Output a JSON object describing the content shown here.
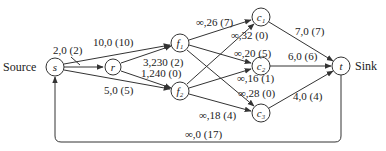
{
  "diagram": {
    "type": "network-flow",
    "source_label": "Source",
    "sink_label": "Sink",
    "nodes": [
      {
        "id": "s",
        "label": "s",
        "x": 55,
        "y": 67
      },
      {
        "id": "r",
        "label": "r",
        "x": 113,
        "y": 67
      },
      {
        "id": "f1",
        "label": "f₁",
        "x": 180,
        "y": 43
      },
      {
        "id": "f2",
        "label": "f₂",
        "x": 180,
        "y": 91
      },
      {
        "id": "c1",
        "label": "c₁",
        "x": 261,
        "y": 17
      },
      {
        "id": "c2",
        "label": "c₂",
        "x": 261,
        "y": 66
      },
      {
        "id": "c3",
        "label": "c₃",
        "x": 261,
        "y": 113
      },
      {
        "id": "t",
        "label": "t",
        "x": 341,
        "y": 66
      }
    ],
    "edges": [
      {
        "from": "s",
        "to": "r",
        "label": "2,0 (2)"
      },
      {
        "from": "s",
        "to": "f1",
        "label": "10,0 (10)"
      },
      {
        "from": "s",
        "to": "f2",
        "label": "5,0 (5)"
      },
      {
        "from": "r",
        "to": "f1",
        "label": "3,230 (2)"
      },
      {
        "from": "r",
        "to": "f2",
        "label": "1,240 (0)"
      },
      {
        "from": "f1",
        "to": "c1",
        "label": "∞,26 (7)"
      },
      {
        "from": "f2",
        "to": "c1",
        "label": "∞,32 (0)"
      },
      {
        "from": "f1",
        "to": "c2",
        "label": "∞,20 (5)"
      },
      {
        "from": "f2",
        "to": "c2",
        "label": "∞,16 (1)"
      },
      {
        "from": "f1",
        "to": "c3",
        "label": "∞,28 (0)"
      },
      {
        "from": "f2",
        "to": "c3",
        "label": "∞,18 (4)"
      },
      {
        "from": "c1",
        "to": "t",
        "label": "7,0 (7)"
      },
      {
        "from": "c2",
        "to": "t",
        "label": "6,0 (6)"
      },
      {
        "from": "c3",
        "to": "t",
        "label": "4,0 (4)"
      },
      {
        "from": "t",
        "to": "s",
        "label": "∞,0 (17)"
      }
    ]
  }
}
